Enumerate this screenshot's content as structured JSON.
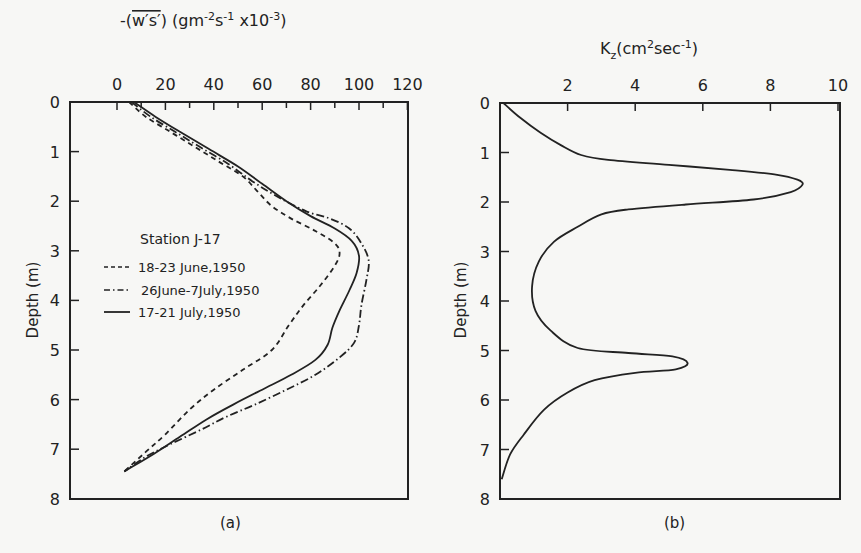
{
  "chart_data": [
    {
      "type": "line",
      "panel_label": "(a)",
      "title": "",
      "xlabel": "-(w's') (gm⁻²s⁻¹ x10⁻³)",
      "ylabel": "Depth (m)",
      "xlim": [
        0,
        120
      ],
      "ylim": [
        8,
        0
      ],
      "x_ticks": [
        0,
        20,
        40,
        60,
        80,
        100,
        120
      ],
      "y_ticks": [
        0,
        1,
        2,
        3,
        4,
        5,
        6,
        7,
        8
      ],
      "x_axis_position": "top",
      "grid": false,
      "legend_title": "Station J-17",
      "legend_position": "inside-left",
      "series": [
        {
          "name": "18-23 June,1950",
          "style": "dashed",
          "points": [
            [
              5,
              0
            ],
            [
              12,
              0.3
            ],
            [
              22,
              0.6
            ],
            [
              32,
              0.9
            ],
            [
              42,
              1.2
            ],
            [
              52,
              1.5
            ],
            [
              58,
              1.8
            ],
            [
              64,
              2.1
            ],
            [
              72,
              2.35
            ],
            [
              82,
              2.6
            ],
            [
              90,
              2.85
            ],
            [
              92,
              3.05
            ],
            [
              90,
              3.3
            ],
            [
              84,
              3.7
            ],
            [
              77,
              4.1
            ],
            [
              71,
              4.5
            ],
            [
              64,
              5.0
            ],
            [
              52,
              5.4
            ],
            [
              40,
              5.8
            ],
            [
              30,
              6.2
            ],
            [
              20,
              6.7
            ],
            [
              12,
              7.05
            ],
            [
              3,
              7.45
            ]
          ]
        },
        {
          "name": "26June-7July,1950",
          "style": "dash-dot",
          "points": [
            [
              6,
              0
            ],
            [
              14,
              0.3
            ],
            [
              24,
              0.6
            ],
            [
              34,
              0.9
            ],
            [
              46,
              1.25
            ],
            [
              56,
              1.6
            ],
            [
              66,
              1.9
            ],
            [
              78,
              2.2
            ],
            [
              88,
              2.35
            ],
            [
              96,
              2.55
            ],
            [
              101,
              2.85
            ],
            [
              104,
              3.2
            ],
            [
              103,
              3.6
            ],
            [
              101,
              4.1
            ],
            [
              100,
              4.5
            ],
            [
              98,
              4.85
            ],
            [
              92,
              5.15
            ],
            [
              82,
              5.5
            ],
            [
              70,
              5.8
            ],
            [
              57,
              6.1
            ],
            [
              45,
              6.35
            ],
            [
              35,
              6.6
            ],
            [
              22,
              6.9
            ],
            [
              12,
              7.15
            ],
            [
              3,
              7.45
            ]
          ]
        },
        {
          "name": "17-21 July,1950",
          "style": "solid",
          "points": [
            [
              7,
              0
            ],
            [
              16,
              0.3
            ],
            [
              26,
              0.6
            ],
            [
              38,
              0.95
            ],
            [
              50,
              1.3
            ],
            [
              60,
              1.65
            ],
            [
              70,
              2.0
            ],
            [
              80,
              2.3
            ],
            [
              90,
              2.55
            ],
            [
              97,
              2.8
            ],
            [
              100,
              3.1
            ],
            [
              99,
              3.45
            ],
            [
              96,
              3.8
            ],
            [
              92,
              4.2
            ],
            [
              89,
              4.55
            ],
            [
              87,
              4.9
            ],
            [
              82,
              5.2
            ],
            [
              72,
              5.5
            ],
            [
              60,
              5.8
            ],
            [
              48,
              6.1
            ],
            [
              37,
              6.4
            ],
            [
              26,
              6.75
            ],
            [
              15,
              7.1
            ],
            [
              3,
              7.45
            ]
          ]
        }
      ]
    },
    {
      "type": "line",
      "panel_label": "(b)",
      "title": "",
      "xlabel": "K_z (cm²sec⁻¹)",
      "ylabel": "Depth (m)",
      "xlim": [
        0,
        10
      ],
      "ylim": [
        8,
        0
      ],
      "x_ticks": [
        2,
        4,
        6,
        8,
        10
      ],
      "y_ticks": [
        0,
        1,
        2,
        3,
        4,
        5,
        6,
        7,
        8
      ],
      "x_axis_position": "top",
      "grid": false,
      "series": [
        {
          "name": "Kz",
          "style": "solid",
          "points": [
            [
              0.1,
              0
            ],
            [
              0.6,
              0.3
            ],
            [
              1.2,
              0.6
            ],
            [
              1.8,
              0.85
            ],
            [
              2.4,
              1.05
            ],
            [
              3.2,
              1.15
            ],
            [
              5.0,
              1.25
            ],
            [
              6.8,
              1.35
            ],
            [
              8.2,
              1.45
            ],
            [
              8.8,
              1.55
            ],
            [
              8.95,
              1.65
            ],
            [
              8.6,
              1.8
            ],
            [
              7.5,
              1.95
            ],
            [
              5.5,
              2.05
            ],
            [
              3.8,
              2.15
            ],
            [
              3.0,
              2.25
            ],
            [
              2.3,
              2.5
            ],
            [
              1.6,
              2.8
            ],
            [
              1.15,
              3.2
            ],
            [
              0.95,
              3.7
            ],
            [
              1.05,
              4.2
            ],
            [
              1.5,
              4.6
            ],
            [
              2.3,
              4.95
            ],
            [
              3.8,
              5.05
            ],
            [
              5.1,
              5.12
            ],
            [
              5.55,
              5.25
            ],
            [
              5.2,
              5.38
            ],
            [
              4.0,
              5.45
            ],
            [
              2.8,
              5.6
            ],
            [
              2.0,
              5.85
            ],
            [
              1.3,
              6.2
            ],
            [
              0.7,
              6.7
            ],
            [
              0.3,
              7.1
            ],
            [
              0.05,
              7.6
            ]
          ]
        }
      ]
    }
  ],
  "panel_a": {
    "x_axis_title_prefix": "-(",
    "x_axis_title_var": "w's'",
    "x_axis_title_units": ") (gm",
    "x_axis_title_full": "-(w's') (gm-2s-1 x10-3)",
    "x_tick_labels": [
      "0",
      "20",
      "40",
      "60",
      "80",
      "100",
      "120"
    ],
    "y_tick_labels": [
      "0",
      "1",
      "2",
      "3",
      "4",
      "5",
      "6",
      "7",
      "8"
    ],
    "y_axis_title": "Depth (m)",
    "legend_title": "Station J-17",
    "legend": [
      "18-23 June,1950",
      "26June-7July,1950",
      "17-21 July,1950"
    ],
    "caption": "(a)"
  },
  "panel_b": {
    "x_axis_title_full": "Kz(cm2sec-1)",
    "x_tick_labels": [
      "2",
      "4",
      "6",
      "8",
      "10"
    ],
    "y_tick_labels": [
      "0",
      "1",
      "2",
      "3",
      "4",
      "5",
      "6",
      "7",
      "8"
    ],
    "y_axis_title": "Depth (m)",
    "caption": "(b)"
  }
}
